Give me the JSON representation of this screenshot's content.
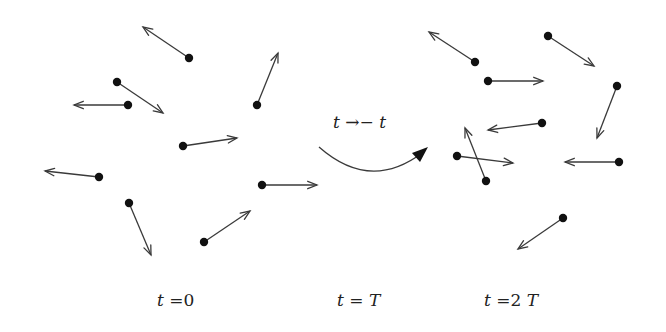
{
  "diagram": {
    "colors": {
      "dot": "#111111",
      "arrow": "#3a3a3a",
      "text": "#222222",
      "background": "#ffffff"
    },
    "transition_label": "t →− t",
    "time_labels": [
      {
        "var": "t",
        "eq": " =0",
        "x": 157
      },
      {
        "var": "t",
        "eq": " = ",
        "suffix": "T",
        "x": 337
      },
      {
        "var": "t",
        "eq": " =2 ",
        "suffix": "T",
        "x": 484
      }
    ],
    "left_particles": [
      {
        "dot": [
          189,
          58
        ],
        "tip": [
          143,
          27
        ]
      },
      {
        "dot": [
          117,
          82
        ],
        "tip": [
          163,
          113
        ]
      },
      {
        "dot": [
          128,
          105
        ],
        "tip": [
          74,
          105
        ]
      },
      {
        "dot": [
          257,
          105
        ],
        "tip": [
          278,
          53
        ]
      },
      {
        "dot": [
          183,
          146
        ],
        "tip": [
          237,
          138
        ]
      },
      {
        "dot": [
          99,
          177
        ],
        "tip": [
          45,
          171
        ]
      },
      {
        "dot": [
          262,
          185
        ],
        "tip": [
          317,
          185
        ]
      },
      {
        "dot": [
          129,
          203
        ],
        "tip": [
          151,
          255
        ]
      },
      {
        "dot": [
          204,
          242
        ],
        "tip": [
          250,
          211
        ]
      }
    ],
    "right_particles": [
      {
        "dot": [
          475,
          62
        ],
        "tip": [
          429,
          32
        ]
      },
      {
        "dot": [
          548,
          36
        ],
        "tip": [
          594,
          66
        ]
      },
      {
        "dot": [
          488,
          81
        ],
        "tip": [
          543,
          81
        ]
      },
      {
        "dot": [
          617,
          86
        ],
        "tip": [
          597,
          138
        ]
      },
      {
        "dot": [
          542,
          123
        ],
        "tip": [
          488,
          130
        ]
      },
      {
        "dot": [
          457,
          156
        ],
        "tip": [
          513,
          163
        ]
      },
      {
        "dot": [
          486,
          181
        ],
        "tip": [
          465,
          128
        ]
      },
      {
        "dot": [
          619,
          162
        ],
        "tip": [
          565,
          162
        ]
      },
      {
        "dot": [
          563,
          218
        ],
        "tip": [
          518,
          249
        ]
      }
    ],
    "curve": {
      "start": [
        319,
        147
      ],
      "control": [
        370,
        192
      ],
      "end": [
        428,
        147
      ]
    }
  }
}
